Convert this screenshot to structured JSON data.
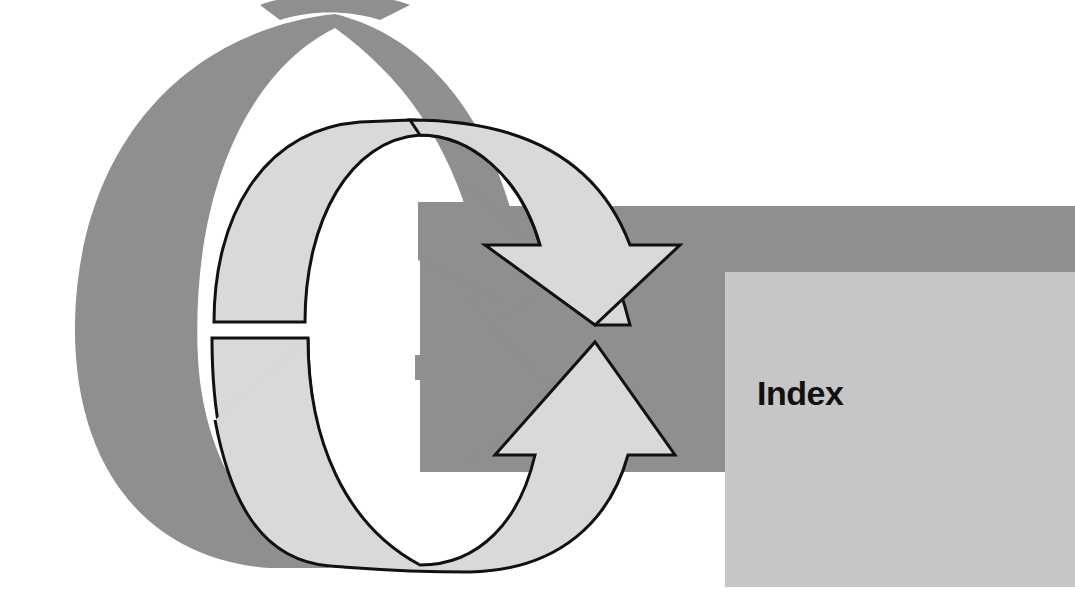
{
  "section": {
    "title": "Index"
  },
  "colors": {
    "background": "#ffffff",
    "shadow_gray": "#8f8f8f",
    "arrow_fill": "#d9d9d9",
    "arrow_stroke": "#111111",
    "box_fill": "#c6c6c6",
    "title_text": "#111111"
  },
  "graphic": {
    "icon": "circular-refresh-arrows"
  }
}
